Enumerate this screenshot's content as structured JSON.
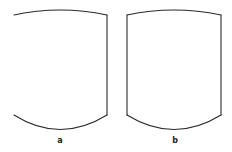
{
  "figures": [
    {
      "id": "a",
      "label": "a",
      "description": "Cylinder-like outline missing its left side: curved top arc, curved bottom arc, right vertical edge only",
      "has_left_side": false,
      "has_right_side": true
    },
    {
      "id": "b",
      "label": "b",
      "description": "Closed cylinder-like outline: curved top arc, curved bottom arc, left and right vertical edges",
      "has_left_side": true,
      "has_right_side": true
    }
  ],
  "colors": {
    "stroke": "#2a2a2a",
    "background": "#ffffff"
  }
}
